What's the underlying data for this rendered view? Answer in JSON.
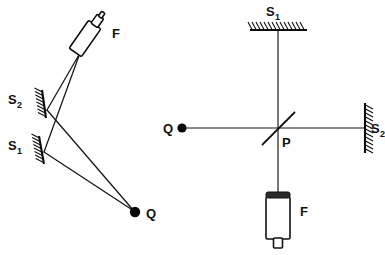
{
  "figure": {
    "background_color": "#ffffff",
    "ink_color": "#111111",
    "width": 385,
    "height": 255
  },
  "left_diagram": {
    "name": "tilted-mirror-interferometer",
    "labels": {
      "telescope": "F",
      "mirror_upper": "S",
      "mirror_upper_subscript": "2",
      "mirror_lower": "S",
      "mirror_lower_subscript": "1",
      "source": "Q"
    },
    "components": [
      {
        "id": "telescope-f",
        "label": "F",
        "kind": "telescope",
        "x": 86,
        "y": 38
      },
      {
        "id": "mirror-s2",
        "label": "S",
        "subscript": "2",
        "kind": "mirror",
        "x": 38,
        "y": 100
      },
      {
        "id": "mirror-s1",
        "label": "S",
        "subscript": "1",
        "kind": "mirror",
        "x": 38,
        "y": 145
      },
      {
        "id": "source-q",
        "label": "Q",
        "kind": "point-source",
        "x": 135,
        "y": 212
      }
    ],
    "ray_paths": [
      {
        "id": "ray-q-to-s2",
        "from": "source-q",
        "to": "mirror-s2"
      },
      {
        "id": "ray-s2-to-f",
        "from": "mirror-s2",
        "to": "telescope-f"
      },
      {
        "id": "ray-q-to-s1",
        "from": "source-q",
        "to": "mirror-s1"
      },
      {
        "id": "ray-s1-to-f",
        "from": "mirror-s1",
        "to": "telescope-f"
      }
    ]
  },
  "right_diagram": {
    "name": "michelson-interferometer",
    "labels": {
      "mirror_top": "S",
      "mirror_top_subscript": "1",
      "mirror_right": "S",
      "mirror_right_subscript": "2",
      "beamsplitter": "P",
      "source": "Q",
      "detector": "F"
    },
    "components": [
      {
        "id": "mirror-s1",
        "label": "S",
        "subscript": "1",
        "kind": "mirror",
        "orientation": "horizontal",
        "x": 278,
        "y": 16
      },
      {
        "id": "mirror-s2",
        "label": "S",
        "subscript": "2",
        "kind": "mirror",
        "orientation": "vertical",
        "x": 367,
        "y": 128
      },
      {
        "id": "beamsplitter-p",
        "label": "P",
        "kind": "beamsplitter",
        "angle_deg": 45,
        "x": 278,
        "y": 128
      },
      {
        "id": "source-q",
        "label": "Q",
        "kind": "point-source",
        "x": 182,
        "y": 128
      },
      {
        "id": "detector-f",
        "label": "F",
        "kind": "detector",
        "x": 278,
        "y": 215
      }
    ],
    "beam_paths": [
      {
        "id": "beam-q-to-p",
        "from": "source-q",
        "to": "beamsplitter-p"
      },
      {
        "id": "beam-p-to-s1",
        "from": "beamsplitter-p",
        "to": "mirror-s1"
      },
      {
        "id": "beam-p-to-s2",
        "from": "beamsplitter-p",
        "to": "mirror-s2"
      },
      {
        "id": "beam-p-to-f",
        "from": "beamsplitter-p",
        "to": "detector-f"
      }
    ]
  }
}
